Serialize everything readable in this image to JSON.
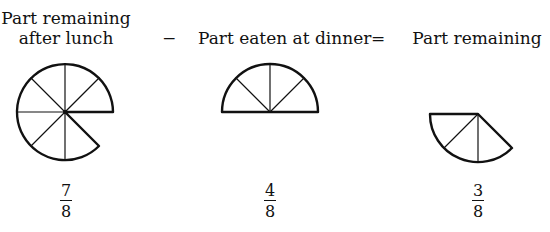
{
  "labels": {
    "left_line1": "Part remaining",
    "left_line2": "after lunch",
    "minus": "−",
    "middle": "Part eaten at dinner",
    "equals": "=",
    "right": "Part remaining"
  },
  "fractions": [
    {
      "numerator": "7",
      "denominator": "8"
    },
    {
      "numerator": "4",
      "denominator": "8"
    },
    {
      "numerator": "3",
      "denominator": "8"
    }
  ],
  "figures": [
    {
      "name": "pie-seven-eighths",
      "slices_shown": 7,
      "slices_total": 8
    },
    {
      "name": "pie-four-eighths",
      "slices_shown": 4,
      "slices_total": 8
    },
    {
      "name": "pie-three-eighths",
      "slices_shown": 3,
      "slices_total": 8
    }
  ],
  "colors": {
    "stroke": "#111111",
    "background": "#ffffff"
  }
}
